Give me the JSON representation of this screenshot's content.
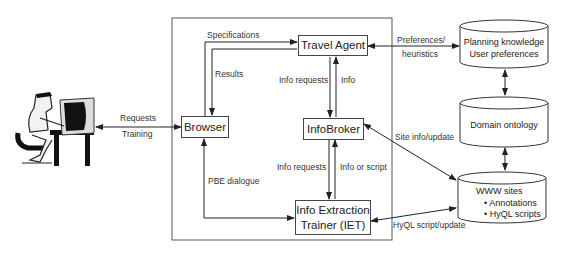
{
  "diagram": {
    "type": "system-architecture",
    "nodes": {
      "user": {
        "label": "",
        "icon": "user-at-computer-icon"
      },
      "browser": {
        "label": "Browser"
      },
      "travel_agent": {
        "label": "Travel Agent"
      },
      "infobroker": {
        "label": "InfoBroker"
      },
      "iet": {
        "label_line1": "Info Extraction",
        "label_line2": "Trainer (IET)"
      },
      "planning_db": {
        "line1": "Planning knowledge",
        "line2": "User preferences"
      },
      "ontology_db": {
        "line1": "Domain ontology"
      },
      "www_db": {
        "line1": "WWW sites",
        "bullet1": "• Annotations",
        "bullet2": "• HyQL scripts"
      }
    },
    "edges": {
      "user_browser_top": "Requests",
      "user_browser_bottom": "Training",
      "browser_to_agent": "Specifications",
      "agent_to_browser": "Results",
      "agent_to_broker": "Info requests",
      "broker_to_agent": "Info",
      "broker_to_iet": "Info requests",
      "iet_to_broker": "Info or script",
      "browser_iet": "PBE dialogue",
      "agent_planning_top": "Preferences/",
      "agent_planning_bottom": "heuristics",
      "broker_www": "Site info/update",
      "iet_www": "HyQL script/update"
    }
  }
}
